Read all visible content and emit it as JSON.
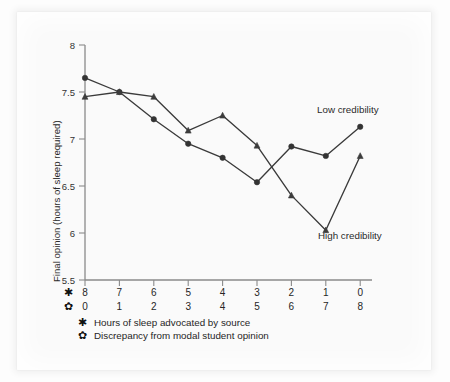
{
  "chart_data": {
    "type": "line",
    "title": "",
    "subtitle": "",
    "xlabel": "",
    "ylabel": "Final opinion (hours of sleep required)",
    "ylim": [
      5.5,
      8.0
    ],
    "y_ticks": [
      "5.5",
      "6",
      "6.5",
      "7",
      "7.5",
      "8"
    ],
    "y_tick_values": [
      5.5,
      6,
      6.5,
      7,
      7.5,
      8
    ],
    "grid": false,
    "legend_position": "inline-annotations",
    "x_axis_rows": [
      {
        "glyph": "✱",
        "glyph_name": "asterisk-marker",
        "description": "Hours of sleep advocated by source",
        "labels": [
          "8",
          "7",
          "6",
          "5",
          "4",
          "3",
          "2",
          "1",
          "0"
        ]
      },
      {
        "glyph": "✿",
        "glyph_name": "flower-marker",
        "description": "Discrepancy from modal student opinion",
        "labels": [
          "0",
          "1",
          "2",
          "3",
          "4",
          "5",
          "6",
          "7",
          "8"
        ]
      }
    ],
    "categories": [
      "8",
      "7",
      "6",
      "5",
      "4",
      "3",
      "2",
      "1",
      "0"
    ],
    "series": [
      {
        "name": "Low credibility",
        "marker": "circle",
        "color": "#333333",
        "annotation": "Low credibility",
        "values": [
          7.65,
          7.5,
          7.21,
          6.95,
          6.8,
          6.54,
          6.92,
          6.82,
          7.13
        ]
      },
      {
        "name": "High credibility",
        "marker": "triangle",
        "color": "#3c3c3c",
        "annotation": "High credibility",
        "values": [
          7.45,
          7.5,
          7.45,
          7.09,
          7.25,
          6.93,
          6.4,
          6.03,
          6.82
        ]
      }
    ],
    "annotations": [
      {
        "text": "Low credibility",
        "x_px": 317,
        "y_px": 113
      },
      {
        "text": "High credibility",
        "x_px": 318,
        "y_px": 239
      }
    ]
  },
  "legend": {
    "entries": [
      {
        "glyph": "✱",
        "label": "Hours of sleep advocated by source"
      },
      {
        "glyph": "✿",
        "label": "Discrepancy from modal student opinion"
      }
    ]
  },
  "axes": {
    "y_title": "Final opinion (hours of sleep required)"
  }
}
